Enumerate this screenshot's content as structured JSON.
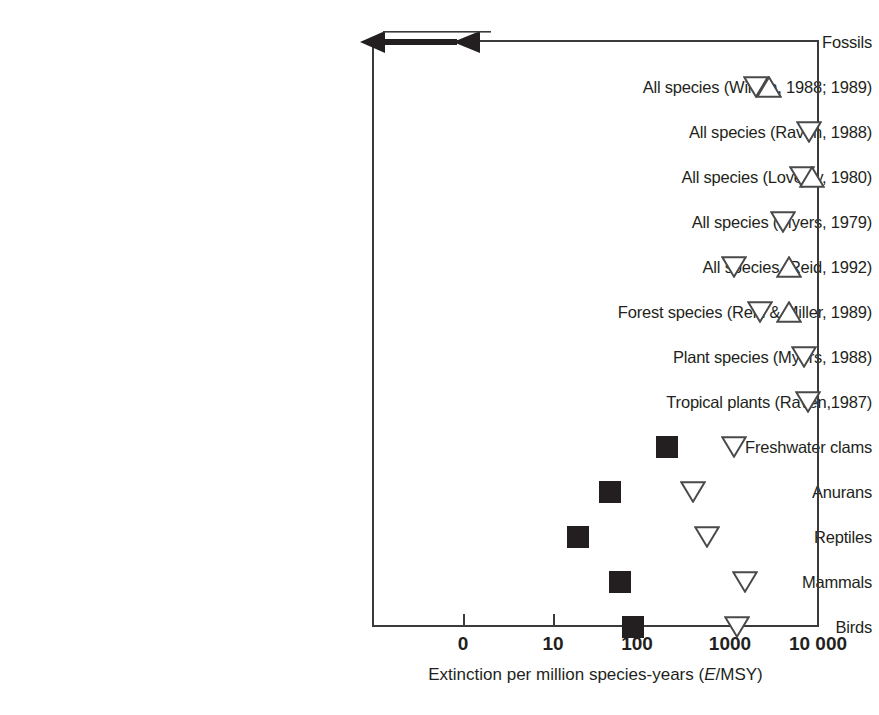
{
  "chart_data": {
    "type": "scatter",
    "title": "",
    "xlabel": "Extinction per million species-years (E/MSY)",
    "ylabel": "",
    "orientation": "horizontal",
    "xscale": "log",
    "xticks": [
      {
        "label": "0",
        "value": 0
      },
      {
        "label": "10",
        "value": 10
      },
      {
        "label": "100",
        "value": 100
      },
      {
        "label": "1000",
        "value": 1000
      },
      {
        "label": "10 000",
        "value": 10000
      }
    ],
    "grid": false,
    "legend": null,
    "marker_types": {
      "square": "filled square = recorded / observed extinction rate",
      "tri-down": "open down triangle = estimate",
      "tri-up": "open up triangle = estimate"
    },
    "categories": [
      "Fossils",
      "All species (Wilson, 1988; 1989)",
      "All species (Raven, 1988)",
      "All species (Lovejoy, 1980)",
      "All species (Myers, 1979)",
      "All species (Reid, 1992)",
      "Forest species (Reid & Miller, 1989)",
      "Plant species (Myers, 1988)",
      "Tropical plants (Raven,1987)",
      "Freshwater clams",
      "Anurans",
      "Reptiles",
      "Mammals",
      "Birds"
    ],
    "rows": [
      {
        "category": "Fossils",
        "range_bar": {
          "from": 0,
          "to": 1.3,
          "arrow_left": true,
          "arrow_right": true
        },
        "points": []
      },
      {
        "category": "All species (Wilson, 1988; 1989)",
        "points": [
          {
            "marker": "tri-down",
            "value": 2000
          },
          {
            "marker": "tri-up",
            "value": 2800
          }
        ]
      },
      {
        "category": "All species (Raven, 1988)",
        "points": [
          {
            "marker": "tri-down",
            "value": 8000
          }
        ]
      },
      {
        "category": "All species (Lovejoy, 1980)",
        "points": [
          {
            "marker": "tri-down",
            "value": 6500
          },
          {
            "marker": "tri-up",
            "value": 8500
          }
        ]
      },
      {
        "category": "All species (Myers, 1979)",
        "points": [
          {
            "marker": "tri-down",
            "value": 4000
          }
        ]
      },
      {
        "category": "All species (Reid, 1992)",
        "points": [
          {
            "marker": "tri-down",
            "value": 1100
          },
          {
            "marker": "tri-up",
            "value": 4700
          }
        ]
      },
      {
        "category": "Forest species (Reid & Miller, 1989)",
        "points": [
          {
            "marker": "tri-down",
            "value": 2200
          },
          {
            "marker": "tri-up",
            "value": 4700
          }
        ]
      },
      {
        "category": "Plant species (Myers, 1988)",
        "points": [
          {
            "marker": "tri-down",
            "value": 7000
          }
        ]
      },
      {
        "category": "Tropical plants (Raven,1987)",
        "points": [
          {
            "marker": "tri-down",
            "value": 7600
          }
        ]
      },
      {
        "category": "Freshwater clams",
        "points": [
          {
            "marker": "square",
            "value": 210
          },
          {
            "marker": "tri-down",
            "value": 1100
          }
        ]
      },
      {
        "category": "Anurans",
        "points": [
          {
            "marker": "square",
            "value": 48
          },
          {
            "marker": "tri-down",
            "value": 400
          }
        ]
      },
      {
        "category": "Reptiles",
        "points": [
          {
            "marker": "square",
            "value": 20
          },
          {
            "marker": "tri-down",
            "value": 560
          }
        ]
      },
      {
        "category": "Mammals",
        "points": [
          {
            "marker": "square",
            "value": 62
          },
          {
            "marker": "tri-down",
            "value": 1500
          }
        ]
      },
      {
        "category": "Birds",
        "points": [
          {
            "marker": "square",
            "value": 90
          },
          {
            "marker": "tri-down",
            "value": 1200
          }
        ]
      }
    ]
  },
  "colors": {
    "ink": "#231f20",
    "frame": "#3b3b3b",
    "background": "#ffffff"
  }
}
